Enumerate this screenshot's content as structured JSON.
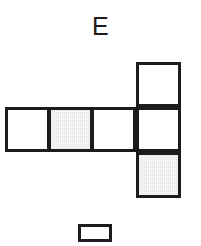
{
  "figure": {
    "label": "E",
    "type": "cube-net-diagram",
    "colors": {
      "stroke": "#1c1c1c",
      "blank_fill": "#ffffff",
      "shaded_fill": "#e3e3e3",
      "background": "#ffffff"
    },
    "geometry": {
      "cell_size": 45,
      "stroke_width": 3,
      "row_top": 107,
      "row_left": 5,
      "column_left": 136,
      "column_top": 62
    },
    "cells": [
      {
        "id": "row-cell-1",
        "name": "net-cell-row-left",
        "fill": "blank",
        "x": 5,
        "y": 107,
        "w": 45,
        "h": 45
      },
      {
        "id": "row-cell-2",
        "name": "net-cell-row-middle",
        "fill": "shaded",
        "x": 48,
        "y": 107,
        "w": 45,
        "h": 45
      },
      {
        "id": "row-cell-3",
        "name": "net-cell-row-right",
        "fill": "blank",
        "x": 91,
        "y": 107,
        "w": 45,
        "h": 45
      },
      {
        "id": "col-cell-1",
        "name": "net-cell-column-top",
        "fill": "blank",
        "x": 136,
        "y": 62,
        "w": 45,
        "h": 45
      },
      {
        "id": "col-cell-2",
        "name": "net-cell-column-middle",
        "fill": "blank",
        "x": 136,
        "y": 107,
        "w": 45,
        "h": 45
      },
      {
        "id": "col-cell-3",
        "name": "net-cell-column-bottom",
        "fill": "shaded",
        "x": 136,
        "y": 152,
        "w": 45,
        "h": 46
      }
    ],
    "legend": {
      "name": "legend-blank-swatch",
      "fill": "blank",
      "x": 78,
      "y": 224,
      "w": 34,
      "h": 18
    }
  }
}
